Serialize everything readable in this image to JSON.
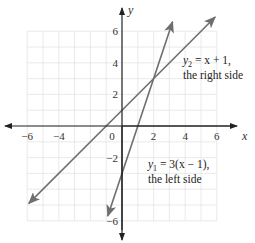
{
  "chart_data": {
    "type": "line",
    "title": "",
    "xlabel": "x",
    "ylabel": "y",
    "xlim": [
      -7.5,
      7
    ],
    "ylim": [
      -7.5,
      7.5
    ],
    "grid": true,
    "x_ticks": [
      -6,
      -4,
      0,
      2,
      4,
      6
    ],
    "x_tick_labels": [
      "−6",
      "−4",
      "0",
      "2",
      "4",
      "6"
    ],
    "y_ticks": [
      6,
      4,
      2,
      -2,
      -6
    ],
    "y_tick_labels": [
      "6",
      "4",
      "2",
      "−2",
      "−6"
    ],
    "series": [
      {
        "name": "y2 = x + 1, the right side",
        "equation": "y = x + 1",
        "x": [
          -5.9,
          5.9
        ],
        "y": [
          -4.9,
          6.9
        ],
        "color": "#666666"
      },
      {
        "name": "y1 = 3(x − 1), the left side",
        "equation": "y = 3(x − 1)",
        "x": [
          -0.9,
          3.2
        ],
        "y": [
          -5.7,
          6.6
        ],
        "color": "#666666"
      }
    ],
    "intersection": {
      "x": 2,
      "y": 3
    },
    "annotations": [
      {
        "line1": "y2 = x + 1,",
        "line2": "the right side",
        "x": 3.2,
        "y": 3.9
      },
      {
        "line1": "y1 = 3(x − 1),",
        "line2": "the left side",
        "x": 1.3,
        "y": -2.5
      }
    ]
  },
  "labels": {
    "x_axis": "x",
    "y_axis": "y",
    "ann_right_y": "y",
    "ann_right_sub": "2",
    "ann_right_eq": " = x + 1,",
    "ann_right_desc": "the right side",
    "ann_left_y": "y",
    "ann_left_sub": "1",
    "ann_left_eq": " = 3(x − 1),",
    "ann_left_desc": "the left side"
  },
  "colors": {
    "grid": "#e4e4e4",
    "axis": "#222222",
    "line": "#6e6e6e"
  }
}
